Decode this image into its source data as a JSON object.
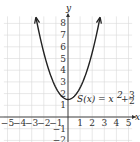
{
  "chart_data": {
    "type": "line",
    "title": "",
    "xlabel": "x",
    "ylabel": "y",
    "xlim": [
      -5,
      5
    ],
    "ylim": [
      -2,
      8
    ],
    "grid": true,
    "x_ticks": [
      -5,
      -4,
      -3,
      -2,
      -1,
      1,
      2,
      3,
      4,
      5
    ],
    "y_ticks": [
      -2,
      -1,
      1,
      2,
      3,
      4,
      5,
      6,
      7,
      8
    ],
    "series": [
      {
        "name": "S(x) = x^2 + 3/2",
        "function": "x^2 + 1.5",
        "x": [
          -2.6,
          -2,
          -1.5,
          -1,
          -0.5,
          0,
          0.5,
          1,
          1.5,
          2,
          2.6
        ],
        "values": [
          8.26,
          5.5,
          3.75,
          2.5,
          1.75,
          1.5,
          1.75,
          2.5,
          3.75,
          5.5,
          8.26
        ]
      }
    ],
    "annotations": [
      {
        "text": "S(x) = x² + 3/2",
        "x": 1.0,
        "y": 2.0
      }
    ]
  },
  "labels": {
    "x_axis": "x",
    "y_axis": "y",
    "function": "S(x) = x",
    "exponent": "2",
    "plus": "+",
    "frac_num": "3",
    "frac_den": "2"
  }
}
